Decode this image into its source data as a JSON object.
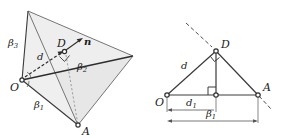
{
  "figure": {
    "width": 287,
    "height": 138,
    "background": "#ffffff",
    "stroke_color": "#333333",
    "fill_color": "#e8e8e8",
    "dashed_color": "#4d4d4d",
    "label_color": "#1a1a1a"
  },
  "left_panel": {
    "name": "3d-tetrahedron-view",
    "points": {
      "O": {
        "label": "O",
        "x": 22,
        "y": 80
      },
      "A": {
        "label": "A",
        "x": 78,
        "y": 125
      },
      "D": {
        "label": "D",
        "x": 64,
        "y": 51
      },
      "apex": {
        "label": "",
        "x": 28,
        "y": 11
      },
      "right": {
        "label": "",
        "x": 133,
        "y": 56
      }
    },
    "labels": {
      "beta3": "β",
      "beta3_sub": "3",
      "beta2": "β",
      "beta2_sub": "2",
      "beta1": "β",
      "beta1_sub": "1",
      "d": "d",
      "n": "n",
      "O": "O",
      "A": "A",
      "D": "D"
    }
  },
  "right_panel": {
    "name": "2d-projection-view",
    "points": {
      "O": {
        "label": "O",
        "x": 167,
        "y": 95
      },
      "A": {
        "label": "A",
        "x": 258,
        "y": 95
      },
      "D": {
        "label": "D",
        "x": 216,
        "y": 51
      },
      "foot": {
        "label": "",
        "x": 216,
        "y": 95
      }
    },
    "labels": {
      "d": "d",
      "d1": "d",
      "d1_sub": "1",
      "beta1": "β",
      "beta1_sub": "1",
      "O": "O",
      "A": "A",
      "D": "D"
    }
  }
}
